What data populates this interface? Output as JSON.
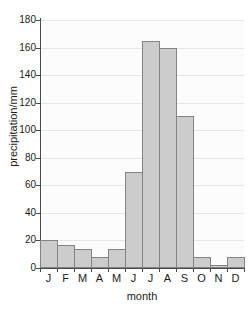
{
  "chart_data": {
    "type": "bar",
    "title": "",
    "xlabel": "month",
    "ylabel": "precipitation/mm",
    "categories": [
      "J",
      "F",
      "M",
      "A",
      "M",
      "J",
      "J",
      "A",
      "S",
      "O",
      "N",
      "D"
    ],
    "values": [
      20,
      17,
      14,
      8,
      14,
      70,
      165,
      160,
      110,
      8,
      2,
      8
    ],
    "ylim": [
      0,
      180
    ],
    "xlim_categories": 12,
    "yticks": [
      0,
      20,
      40,
      60,
      80,
      100,
      120,
      140,
      160,
      180
    ],
    "ytick_labels": [
      "0",
      "20",
      "40",
      "60",
      "80",
      "100",
      "120",
      "140",
      "160",
      "180"
    ],
    "grid": "horizontal",
    "legend": "none",
    "bar_fill_color": "#cccccc",
    "bar_edge_color": "#838383",
    "axis_color": "#4a4a4a",
    "gridline_color": "#e6e6e6",
    "plot_background": "#fcfcfc",
    "page_background": "#ffffff"
  }
}
